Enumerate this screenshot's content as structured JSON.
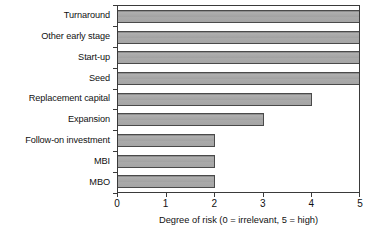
{
  "chart_data": {
    "type": "bar",
    "orientation": "horizontal",
    "title": "",
    "xlabel": "Degree of risk (0 = irrelevant, 5 = high)",
    "ylabel": "",
    "categories": [
      "Turnaround",
      "Other early stage",
      "Start-up",
      "Seed",
      "Replacement capital",
      "Expansion",
      "Follow-on investment",
      "MBI",
      "MBO"
    ],
    "values": [
      5,
      5,
      5,
      5,
      4,
      3,
      2,
      2,
      2
    ],
    "xlim": [
      0,
      5
    ],
    "xticks": [
      0,
      1,
      2,
      3,
      4,
      5
    ],
    "xtick_labels": [
      "0",
      "1",
      "2",
      "3",
      "4",
      "5"
    ],
    "grid": false,
    "legend": null,
    "bar_color": "#a6a6a6",
    "bar_edge_color": "#4a4a4a",
    "axis_color": "#3a3a3a",
    "background": "#ffffff"
  }
}
